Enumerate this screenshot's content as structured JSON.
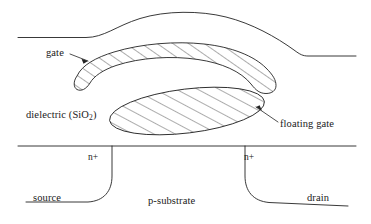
{
  "figure": {
    "type": "device-cross-section-diagram",
    "stroke_color": "#232323",
    "background_color": "#ffffff"
  },
  "labels": {
    "gate": "gate",
    "dielectric": "dielectric (SiO",
    "dielectric_sub": "2",
    "dielectric_close": ")",
    "floating_gate": "floating gate",
    "n_plus_source": "n+",
    "n_plus_drain": "n+",
    "source": "source",
    "substrate": "p-substrate",
    "drain": "drain"
  },
  "regions": [
    {
      "name": "control-gate-outline",
      "description": "outer curved control gate boundary, unhatched"
    },
    {
      "name": "control-gate-body",
      "description": "hatched crescent band, the gate electrode"
    },
    {
      "name": "floating-gate-body",
      "description": "hatched tilted ellipse below the gate"
    },
    {
      "name": "substrate-surface",
      "description": "horizontal silicon surface line"
    },
    {
      "name": "source-junction",
      "description": "n+ source diffusion boundary, left"
    },
    {
      "name": "drain-junction",
      "description": "n+ drain diffusion boundary, right"
    }
  ]
}
